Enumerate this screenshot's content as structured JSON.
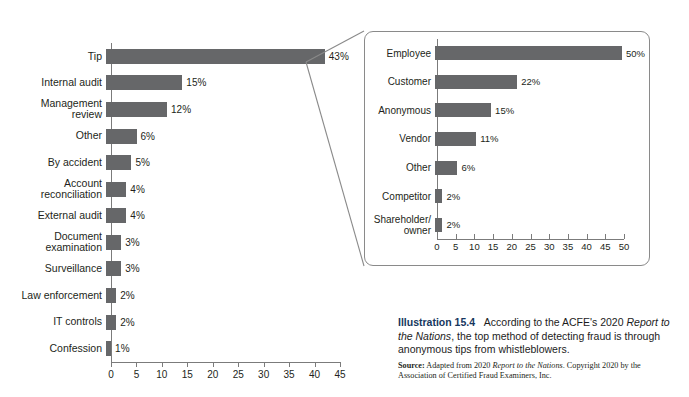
{
  "colors": {
    "bar": "#666769",
    "axis": "#7b7b7b",
    "text": "#231f20",
    "accent": "#16375e",
    "inset_border": "#8a8a8a"
  },
  "chart_data": [
    {
      "id": "main",
      "type": "bar",
      "orientation": "horizontal",
      "title": "",
      "xlabel": "",
      "ylabel": "",
      "xlim": [
        0,
        45
      ],
      "xticks": [
        0,
        5,
        10,
        15,
        20,
        25,
        30,
        35,
        40,
        45
      ],
      "grid": false,
      "legend": "none",
      "categories": [
        "Tip",
        "Internal audit",
        "Management\nreview",
        "Other",
        "By accident",
        "Account\nreconciliation",
        "External audit",
        "Document\nexamination",
        "Surveillance",
        "Law enforcement",
        "IT controls",
        "Confession"
      ],
      "values": [
        43,
        15,
        12,
        6,
        5,
        4,
        4,
        3,
        3,
        2,
        2,
        1
      ],
      "data_labels": [
        "43%",
        "15%",
        "12%",
        "6%",
        "5%",
        "4%",
        "4%",
        "3%",
        "3%",
        "2%",
        "2%",
        "1%"
      ]
    },
    {
      "id": "inset",
      "type": "bar",
      "orientation": "horizontal",
      "title": "",
      "xlabel": "",
      "ylabel": "",
      "xlim": [
        0,
        50
      ],
      "xticks": [
        0,
        5,
        10,
        15,
        20,
        25,
        30,
        35,
        40,
        45,
        50
      ],
      "grid": false,
      "legend": "none",
      "categories": [
        "Employee",
        "Customer",
        "Anonymous",
        "Vendor",
        "Other",
        "Competitor",
        "Shareholder/\nowner"
      ],
      "values": [
        50,
        22,
        15,
        11,
        6,
        2,
        2
      ],
      "data_labels": [
        "50%",
        "22%",
        "15%",
        "11%",
        "6%",
        "2%",
        "2%"
      ]
    }
  ],
  "caption": {
    "illustration_number": "Illustration 15.4",
    "text_part1": "According to the ACFE's 2020 ",
    "text_italic1": "Report to the Nations",
    "text_part2": ", the top method of detecting fraud is through anonymous tips from whistleblowers.",
    "source_label": "Source:",
    "source_part1": " Adapted from 2020 ",
    "source_italic1": "Report to the Nations",
    "source_part2": ". Copyright 2020 by the Association of Certified Fraud Examiners, Inc."
  }
}
